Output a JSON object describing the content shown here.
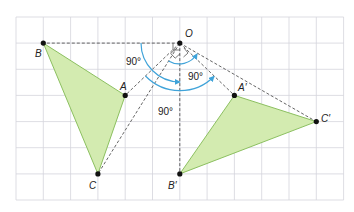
{
  "diagram": {
    "type": "rotation-on-grid",
    "grid": {
      "cols": 12,
      "rows": 7,
      "color": "#d4d4dc"
    },
    "colors": {
      "triangle_fill": "#d3ebb0",
      "triangle_stroke": "#8cc060",
      "arc": "#3fa3d9",
      "dash": "#555555",
      "point": "#111111"
    },
    "points": {
      "O": {
        "label": "O"
      },
      "A": {
        "label": "A"
      },
      "B": {
        "label": "B"
      },
      "C": {
        "label": "C"
      },
      "A_prime": {
        "label": "A′"
      },
      "B_prime": {
        "label": "B′"
      },
      "C_prime": {
        "label": "C′"
      }
    },
    "angles": [
      {
        "label": "90°"
      },
      {
        "label": "90°"
      },
      {
        "label": "90°"
      }
    ]
  }
}
